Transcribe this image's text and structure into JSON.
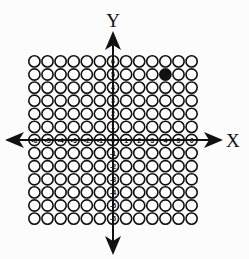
{
  "diagram": {
    "type": "coordinate-grid",
    "x_axis_label": "X",
    "y_axis_label": "Y",
    "x_range": [
      -6,
      6
    ],
    "y_range": [
      -6,
      6
    ],
    "x_tick_labels": [
      "-6",
      "-5",
      "-4",
      "-3",
      "-2",
      "-1",
      "0",
      "1",
      "2",
      "3",
      "4",
      "5",
      "6"
    ],
    "y_tick_labels": [
      "6",
      "5",
      "4",
      "3",
      "2",
      "1",
      "0",
      "-1",
      "-2",
      "-3",
      "-4",
      "-5",
      "-6"
    ],
    "filled_points": [
      {
        "x": 4,
        "y": 5
      }
    ],
    "colors": {
      "stroke": "#111111",
      "fill_point": "#111111",
      "background": "#fcfcfc"
    }
  }
}
